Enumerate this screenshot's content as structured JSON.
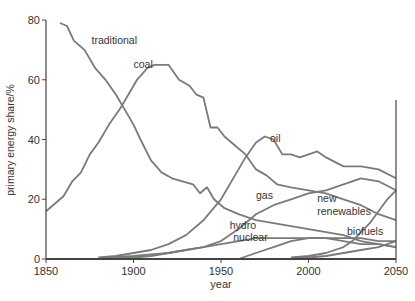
{
  "chart_data": {
    "type": "line",
    "title": "",
    "xlabel": "year",
    "ylabel": "primary energy share/%",
    "xlim": [
      1850,
      2050
    ],
    "ylim": [
      0,
      80
    ],
    "xticks": [
      1850,
      1900,
      1950,
      2000,
      2050
    ],
    "yticks": [
      0,
      20,
      40,
      60,
      80
    ],
    "grid": false,
    "legend": "inline labels",
    "series": [
      {
        "name": "traditional",
        "label_pos": [
          1876,
          72
        ],
        "x": [
          1858,
          1862,
          1866,
          1872,
          1878,
          1884,
          1890,
          1896,
          1900,
          1904,
          1910,
          1916,
          1922,
          1928,
          1934,
          1938,
          1942,
          1946,
          1952,
          1960,
          1970,
          1980,
          1990,
          2000,
          2010,
          2020,
          2030,
          2040,
          2050
        ],
        "values": [
          79,
          78,
          73,
          70,
          64,
          60,
          55,
          49,
          45,
          40,
          33,
          29,
          27,
          26,
          25,
          22,
          24,
          20,
          17,
          15,
          13,
          12,
          11,
          10,
          9,
          8,
          6,
          5,
          4
        ]
      },
      {
        "name": "coal",
        "label_pos": [
          1900,
          64
        ],
        "x": [
          1850,
          1860,
          1865,
          1870,
          1875,
          1880,
          1886,
          1892,
          1897,
          1902,
          1908,
          1912,
          1920,
          1926,
          1932,
          1936,
          1940,
          1944,
          1948,
          1952,
          1958,
          1964,
          1970,
          1976,
          1982,
          1990,
          2000,
          2010,
          2020,
          2030,
          2040,
          2050
        ],
        "values": [
          16,
          21,
          26,
          29,
          35,
          39,
          45,
          50,
          55,
          60,
          64,
          65,
          65,
          60,
          58,
          55,
          54,
          44,
          44,
          41,
          38,
          35,
          30,
          28,
          25,
          24,
          23,
          22,
          20,
          18,
          15,
          13
        ]
      },
      {
        "name": "oil",
        "label_pos": [
          1978,
          39
        ],
        "x": [
          1880,
          1890,
          1900,
          1910,
          1920,
          1930,
          1940,
          1950,
          1958,
          1964,
          1970,
          1975,
          1980,
          1985,
          1990,
          1995,
          2000,
          2005,
          2010,
          2020,
          2030,
          2040,
          2050
        ],
        "values": [
          0.5,
          1,
          2,
          3,
          5,
          8,
          13,
          20,
          28,
          34,
          39,
          41,
          40,
          35,
          35,
          34,
          35,
          36,
          34,
          31,
          31,
          30,
          27
        ]
      },
      {
        "name": "gas",
        "label_pos": [
          1970,
          20
        ],
        "x": [
          1880,
          1900,
          1910,
          1920,
          1930,
          1940,
          1950,
          1960,
          1970,
          1980,
          1990,
          2000,
          2010,
          2020,
          2030,
          2040,
          2050
        ],
        "values": [
          0.3,
          1,
          1.5,
          2,
          3,
          4,
          6,
          10,
          15,
          18,
          20,
          22,
          23,
          25,
          27,
          26,
          23
        ]
      },
      {
        "name": "new renewables",
        "label_pos": [
          2005,
          19
        ],
        "x": [
          1990,
          2000,
          2010,
          2015,
          2020,
          2025,
          2030,
          2035,
          2040,
          2045,
          2050
        ],
        "values": [
          0.5,
          1,
          2,
          3,
          4,
          6,
          9,
          12,
          16,
          20,
          23
        ]
      },
      {
        "name": "hydro",
        "label_pos": [
          1955,
          10
        ],
        "x": [
          1890,
          1900,
          1910,
          1920,
          1930,
          1940,
          1950,
          1960,
          1970,
          1980,
          1990,
          2000,
          2010,
          2020,
          2030,
          2040,
          2050
        ],
        "values": [
          0.2,
          0.5,
          1,
          2,
          3,
          4,
          5,
          6,
          7,
          7,
          7,
          7,
          7,
          7,
          7,
          6,
          6
        ]
      },
      {
        "name": "nuclear",
        "label_pos": [
          1957,
          6
        ],
        "x": [
          1960,
          1965,
          1970,
          1975,
          1980,
          1985,
          1990,
          2000,
          2010,
          2020,
          2030,
          2040,
          2050
        ],
        "values": [
          0,
          1,
          2,
          3,
          4,
          5,
          6,
          7,
          7,
          6,
          5,
          5,
          4
        ]
      },
      {
        "name": "biofuels",
        "label_pos": [
          2022,
          8
        ],
        "x": [
          1990,
          2000,
          2010,
          2015,
          2020,
          2030,
          2040,
          2050
        ],
        "values": [
          0.2,
          0.5,
          1,
          1.5,
          2,
          3,
          4,
          6
        ]
      }
    ]
  },
  "colors": {
    "line": "#7a7a7a",
    "axis": "#444444",
    "text": "#333333"
  }
}
